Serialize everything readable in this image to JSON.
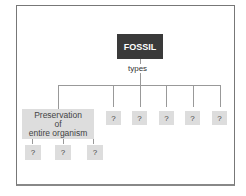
{
  "diagram": {
    "root": "FOSSIL",
    "relation": "types",
    "types": [
      {
        "label": "Preservation\nof\nentire organism",
        "children": [
          "?",
          "?",
          "?"
        ]
      },
      {
        "label": "?"
      },
      {
        "label": "?"
      },
      {
        "label": "?"
      },
      {
        "label": "?"
      },
      {
        "label": "?"
      }
    ]
  }
}
